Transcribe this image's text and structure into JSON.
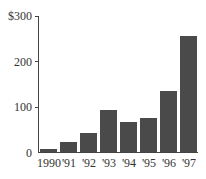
{
  "chart_data": {
    "type": "bar",
    "title": "",
    "xlabel": "",
    "ylabel": "",
    "categories": [
      "1990",
      "'91",
      "'92",
      "'93",
      "'94",
      "'95",
      "'96",
      "'97"
    ],
    "values": [
      6,
      22,
      42,
      91,
      66,
      74,
      133,
      255
    ],
    "ylim": [
      0,
      300
    ],
    "yticks": [
      "0",
      "100",
      "200",
      "$300"
    ],
    "grid": false,
    "legend": null,
    "bar_color": "#4a4a4a"
  }
}
